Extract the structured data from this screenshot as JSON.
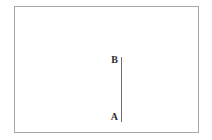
{
  "figure": {
    "background_color": "#ffffff",
    "frame": {
      "border_color": "#a8a8a8",
      "border_width_px": 1
    },
    "segment": {
      "name": "AB",
      "color": "#6e6e6e",
      "orientation": "vertical",
      "thickness_px": 1
    },
    "labels": {
      "top": "B",
      "bottom": "A"
    }
  }
}
